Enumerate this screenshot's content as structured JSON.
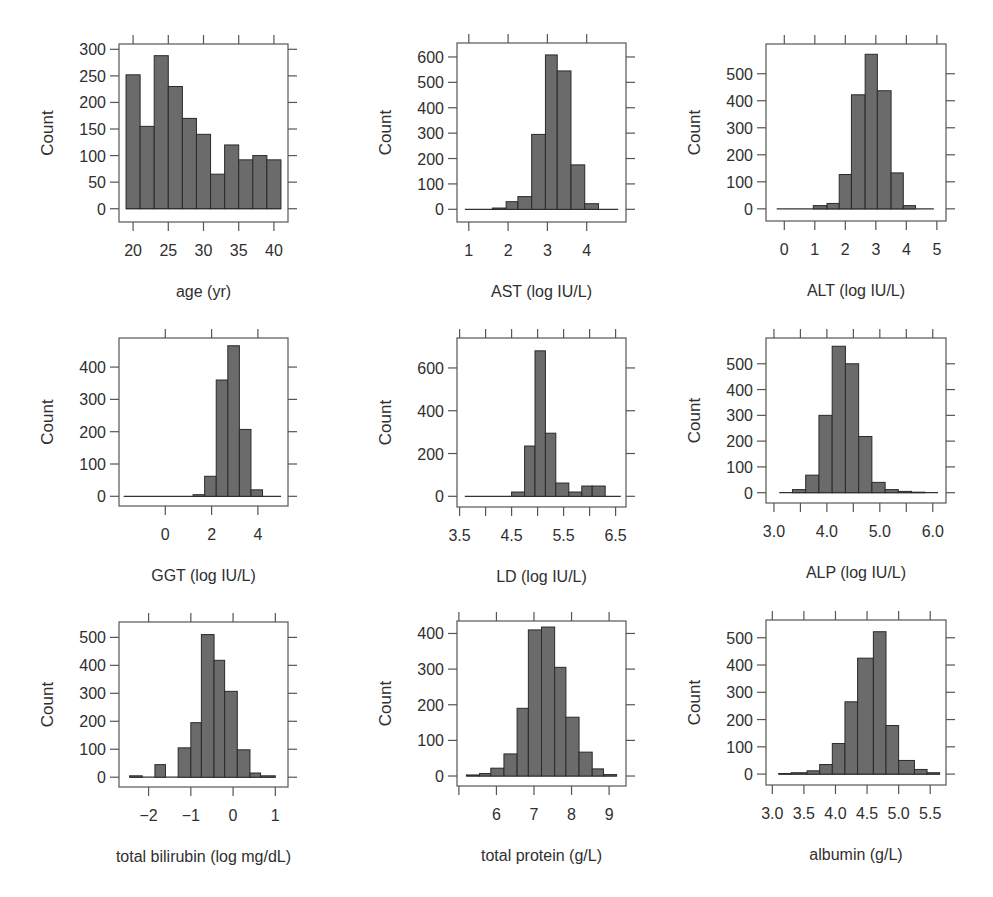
{
  "figure": {
    "bar_fill": "#6b6b6b",
    "bar_stroke": "#2a2a2a",
    "axis_color": "#555555"
  },
  "chart_data": [
    {
      "type": "bar",
      "title": "",
      "xlabel": "age (yr)",
      "ylabel": "Count",
      "bin_edges": [
        19,
        21,
        23,
        25,
        27,
        29,
        31,
        33,
        35,
        37,
        39,
        41
      ],
      "values": [
        252,
        155,
        288,
        230,
        170,
        140,
        65,
        120,
        92,
        100,
        92,
        44
      ],
      "xticks": [
        20,
        25,
        30,
        35,
        40
      ],
      "xtick_labels": [
        "20",
        "25",
        "30",
        "35",
        "40"
      ],
      "yticks": [
        0,
        50,
        100,
        150,
        200,
        250,
        300
      ],
      "ytick_labels": [
        "0",
        "50",
        "100",
        "150",
        "200",
        "250",
        "300"
      ],
      "xlim": [
        18,
        42
      ],
      "ylim": [
        -25,
        310
      ],
      "grid": false
    },
    {
      "type": "bar",
      "title": "",
      "xlabel": "AST (log IU/L)",
      "ylabel": "Count",
      "bin_edges": [
        0.9,
        1.25,
        1.6,
        1.95,
        2.25,
        2.6,
        2.95,
        3.25,
        3.6,
        3.95,
        4.3,
        4.8
      ],
      "values": [
        0,
        0,
        5,
        30,
        50,
        295,
        608,
        545,
        175,
        22,
        0
      ],
      "xticks": [
        1,
        2,
        3,
        4
      ],
      "xtick_labels": [
        "1",
        "2",
        "3",
        "4"
      ],
      "yticks": [
        0,
        100,
        200,
        300,
        400,
        500,
        600
      ],
      "ytick_labels": [
        "0",
        "100",
        "200",
        "300",
        "400",
        "500",
        "600"
      ],
      "xlim": [
        0.7,
        5.0
      ],
      "ylim": [
        -50,
        655
      ],
      "grid": false
    },
    {
      "type": "bar",
      "title": "",
      "xlabel": "ALT (log IU/L)",
      "ylabel": "Count",
      "bin_edges": [
        -0.25,
        0.1,
        0.5,
        0.95,
        1.4,
        1.8,
        2.2,
        2.65,
        3.05,
        3.5,
        3.9,
        4.3,
        4.9
      ],
      "values": [
        0,
        0,
        0,
        12,
        20,
        127,
        422,
        572,
        437,
        133,
        12,
        0
      ],
      "xticks": [
        0,
        1,
        2,
        3,
        4,
        5
      ],
      "xtick_labels": [
        "0",
        "1",
        "2",
        "3",
        "4",
        "5"
      ],
      "yticks": [
        0,
        100,
        200,
        300,
        400,
        500
      ],
      "ytick_labels": [
        "0",
        "100",
        "200",
        "300",
        "400",
        "500"
      ],
      "xlim": [
        -0.6,
        5.3
      ],
      "ylim": [
        -45,
        610
      ],
      "grid": false
    },
    {
      "type": "bar",
      "title": "",
      "xlabel": "GGT (log IU/L)",
      "ylabel": "Count",
      "bin_edges": [
        -1.8,
        -1.2,
        -0.6,
        0,
        0.6,
        1.2,
        1.7,
        2.2,
        2.7,
        3.2,
        3.7,
        4.2,
        5.0
      ],
      "values": [
        0,
        0,
        0,
        0,
        0,
        5,
        62,
        360,
        466,
        207,
        20,
        0
      ],
      "xticks": [
        0,
        2,
        4
      ],
      "xtick_labels": [
        "0",
        "2",
        "4"
      ],
      "yticks": [
        0,
        100,
        200,
        300,
        400
      ],
      "ytick_labels": [
        "0",
        "100",
        "200",
        "300",
        "400"
      ],
      "xlim": [
        -2.0,
        5.3
      ],
      "ylim": [
        -30,
        490
      ],
      "grid": false
    },
    {
      "type": "bar",
      "title": "",
      "xlabel": "LD (log IU/L)",
      "ylabel": "Count",
      "bin_edges": [
        3.6,
        3.9,
        4.2,
        4.5,
        4.75,
        4.95,
        5.15,
        5.35,
        5.6,
        5.85,
        6.05,
        6.3,
        6.6
      ],
      "values": [
        0,
        0,
        0,
        20,
        235,
        680,
        295,
        62,
        20,
        48,
        48,
        0
      ],
      "xticks": [
        3.5,
        4.0,
        4.5,
        5.0,
        5.5,
        6.0,
        6.5
      ],
      "xtick_labels": [
        "3.5",
        "",
        "4.5",
        "",
        "5.5",
        "",
        "6.5"
      ],
      "yticks": [
        0,
        200,
        400,
        600
      ],
      "ytick_labels": [
        "0",
        "200",
        "400",
        "600"
      ],
      "xlim": [
        3.45,
        6.7
      ],
      "ylim": [
        -50,
        740
      ],
      "grid": false
    },
    {
      "type": "bar",
      "title": "",
      "xlabel": "ALP (log IU/L)",
      "ylabel": "Count",
      "bin_edges": [
        3.1,
        3.35,
        3.6,
        3.85,
        4.1,
        4.35,
        4.6,
        4.85,
        5.1,
        5.35,
        5.6,
        5.85,
        6.1
      ],
      "values": [
        0,
        12,
        68,
        300,
        568,
        500,
        218,
        40,
        12,
        5,
        2,
        0
      ],
      "xticks": [
        3.0,
        3.5,
        4.0,
        4.5,
        5.0,
        5.5,
        6.0
      ],
      "xtick_labels": [
        "3.0",
        "",
        "4.0",
        "",
        "5.0",
        "",
        "6.0"
      ],
      "yticks": [
        0,
        100,
        200,
        300,
        400,
        500
      ],
      "ytick_labels": [
        "0",
        "100",
        "200",
        "300",
        "400",
        "500"
      ],
      "xlim": [
        2.85,
        6.25
      ],
      "ylim": [
        -40,
        600
      ],
      "grid": false
    },
    {
      "type": "bar",
      "title": "",
      "xlabel": "total bilirubin (log mg/dL)",
      "ylabel": "Count",
      "bin_edges": [
        -2.45,
        -2.15,
        -1.85,
        -1.6,
        -1.3,
        -1.0,
        -0.75,
        -0.45,
        -0.2,
        0.1,
        0.4,
        0.65,
        1.0
      ],
      "values": [
        5,
        0,
        45,
        0,
        105,
        195,
        510,
        418,
        307,
        98,
        15,
        5
      ],
      "xticks": [
        -2,
        -1,
        0,
        1
      ],
      "xtick_labels": [
        "−2",
        "−1",
        "0",
        "1"
      ],
      "yticks": [
        0,
        100,
        200,
        300,
        400,
        500
      ],
      "ytick_labels": [
        "0",
        "100",
        "200",
        "300",
        "400",
        "500"
      ],
      "xlim": [
        -2.7,
        1.3
      ],
      "ylim": [
        -35,
        555
      ],
      "grid": false
    },
    {
      "type": "bar",
      "title": "",
      "xlabel": "total protein (g/L)",
      "ylabel": "Count",
      "bin_edges": [
        5.2,
        5.55,
        5.85,
        6.2,
        6.55,
        6.85,
        7.2,
        7.55,
        7.85,
        8.2,
        8.55,
        8.85,
        9.2
      ],
      "values": [
        3,
        7,
        22,
        62,
        190,
        410,
        418,
        305,
        165,
        67,
        20,
        4
      ],
      "xticks": [
        5,
        6,
        7,
        8,
        9
      ],
      "xtick_labels": [
        "",
        "6",
        "7",
        "8",
        "9"
      ],
      "yticks": [
        0,
        100,
        200,
        300,
        400
      ],
      "ytick_labels": [
        "0",
        "100",
        "200",
        "300",
        "400"
      ],
      "xlim": [
        4.95,
        9.45
      ],
      "ylim": [
        -28,
        435
      ],
      "grid": false
    },
    {
      "type": "bar",
      "title": "",
      "xlabel": "albumin (g/L)",
      "ylabel": "Count",
      "bin_edges": [
        3.1,
        3.3,
        3.55,
        3.75,
        3.95,
        4.15,
        4.35,
        4.6,
        4.8,
        5.0,
        5.25,
        5.45,
        5.65
      ],
      "values": [
        2,
        5,
        12,
        35,
        112,
        265,
        425,
        522,
        178,
        50,
        17,
        5
      ],
      "xticks": [
        3.0,
        3.5,
        4.0,
        4.5,
        5.0,
        5.5
      ],
      "xtick_labels": [
        "3.0",
        "3.5",
        "4.0",
        "4.5",
        "5.0",
        "5.5"
      ],
      "yticks": [
        0,
        100,
        200,
        300,
        400,
        500
      ],
      "ytick_labels": [
        "0",
        "100",
        "200",
        "300",
        "400",
        "500"
      ],
      "xlim": [
        2.9,
        5.75
      ],
      "ylim": [
        -40,
        565
      ],
      "grid": false
    }
  ]
}
